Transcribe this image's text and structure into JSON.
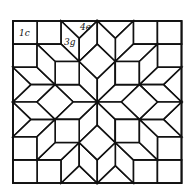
{
  "diagram": {
    "type": "quilt-block",
    "frame": {
      "left": 13,
      "top": 21,
      "right": 181.5,
      "bottom": 183
    },
    "grid_units": 7,
    "line_color": "#111111",
    "background": "#ffffff",
    "labels": [
      {
        "id": "label-1c",
        "text": "1c",
        "x": 19,
        "y": 36
      },
      {
        "id": "label-4e",
        "text": "4e",
        "x": 80,
        "y": 30
      },
      {
        "id": "label-3g",
        "text": "3g",
        "x": 64,
        "y": 45
      }
    ],
    "base_polygons": [
      [
        [
          -3.5,
          -3.5
        ],
        [
          -2.5,
          -3.5
        ],
        [
          -2.5,
          -2.5
        ],
        [
          -3.5,
          -2.5
        ]
      ],
      [
        [
          -2.5,
          -3.5
        ],
        [
          -1.5,
          -3.5
        ],
        [
          -1.5,
          -2.5
        ],
        [
          -2.5,
          -2.5
        ]
      ],
      [
        [
          -1.5,
          -3.5
        ],
        [
          -0.75,
          -2.75
        ],
        [
          0,
          -3.5
        ]
      ],
      [
        [
          -1.5,
          -3.5
        ],
        [
          -0.75,
          -2.75
        ],
        [
          -0.75,
          -1.75
        ],
        [
          -1.5,
          -2.5
        ]
      ],
      [
        [
          -0.75,
          -2.75
        ],
        [
          0,
          -3.5
        ],
        [
          0,
          -2.5
        ],
        [
          -0.75,
          -1.75
        ]
      ],
      [
        [
          0,
          -2.5
        ],
        [
          -0.75,
          -1.75
        ],
        [
          0,
          -1
        ],
        [
          0.75,
          -1.75
        ]
      ],
      [
        [
          -0.75,
          -1.75
        ],
        [
          -0.75,
          -0.75
        ],
        [
          0,
          0
        ],
        [
          0,
          -1
        ]
      ],
      [
        [
          -1.75,
          -1.75
        ],
        [
          -0.75,
          -1.75
        ],
        [
          -0.75,
          -0.75
        ],
        [
          -1.75,
          -0.75
        ]
      ],
      [
        [
          -2.5,
          -2.5
        ],
        [
          -1.5,
          -2.5
        ],
        [
          -0.75,
          -1.75
        ],
        [
          -1.75,
          -1.75
        ]
      ]
    ]
  }
}
